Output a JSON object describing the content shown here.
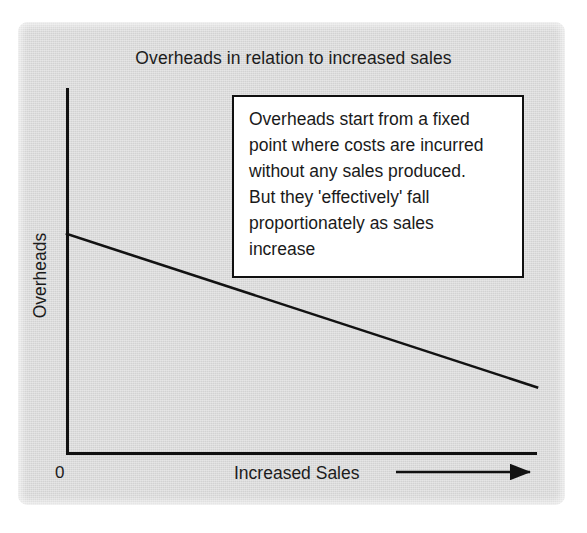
{
  "chart_data": {
    "type": "line",
    "title": "Overheads in relation to increased sales",
    "xlabel": "Increased Sales",
    "ylabel": "Overheads",
    "origin_label": "0",
    "grid": false,
    "legend": "none",
    "axis_arrow": "right-arrow-x-axis",
    "xlim": [
      0,
      100
    ],
    "ylim": [
      0,
      100
    ],
    "series": [
      {
        "name": "Overheads",
        "x": [
          0,
          100
        ],
        "y": [
          60,
          18
        ],
        "description": "Straight downward-sloping line from a fixed starting point on the Overheads axis, falling as Increased Sales rises"
      }
    ],
    "annotations": [
      {
        "name": "overheads-explanation",
        "lines": [
          "Overheads start from a fixed",
          "point where costs are incurred",
          "without any sales produced.",
          "But they 'effectively' fall",
          "proportionately as sales",
          "increase"
        ]
      }
    ]
  },
  "figure": {
    "panel_color": "#d2d2d2",
    "ink_color": "#121212",
    "box_fill": "#ffffff"
  }
}
